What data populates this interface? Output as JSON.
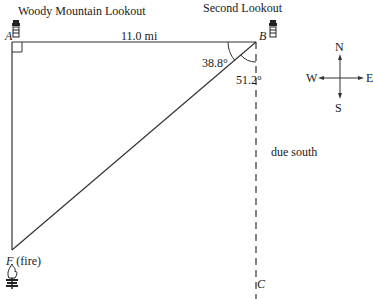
{
  "diagram": {
    "type": "right-triangle-navigation",
    "labels": {
      "title_a": "Woody Mountain Lookout",
      "title_b": "Second Lookout",
      "point_a": "A",
      "point_b": "B",
      "point_c": "C",
      "point_f": "F",
      "fire_label": "(fire)",
      "distance_ab": "11.0 mi",
      "angle_abf": "38.8°",
      "angle_fbc": "51.2°",
      "due_south": "due south"
    },
    "compass": {
      "north": "N",
      "south": "S",
      "east": "E",
      "west": "W"
    },
    "icons": {
      "lookout_a": "lookout-tower-icon",
      "lookout_b": "lookout-tower-icon",
      "fire": "fire-icon"
    },
    "colors": {
      "line": "#333333",
      "text": "#1a1a1a",
      "background": "#ffffff"
    }
  }
}
